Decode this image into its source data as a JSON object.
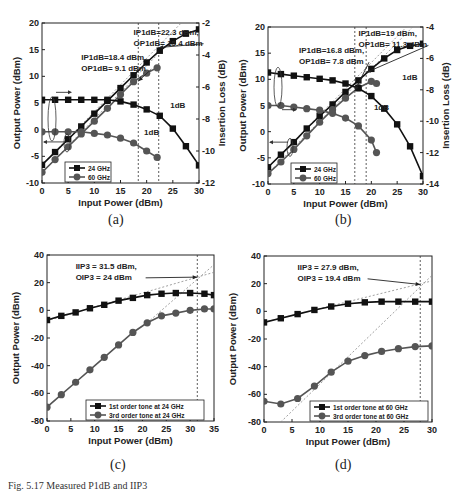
{
  "panels": [
    {
      "label": "(a)"
    },
    {
      "label": "(b)"
    },
    {
      "label": "(c)"
    },
    {
      "label": "(d)"
    }
  ],
  "caption": "Fig. 5.17  Measured P1dB and IIP3",
  "chart_data": [
    {
      "id": "a",
      "type": "line",
      "xlabel": "Input Power (dBm)",
      "ylabel": "Output Power (dBm)",
      "y2label": "Insertion Loss (dB)",
      "xlim": [
        0,
        30
      ],
      "ylim": [
        -10,
        20
      ],
      "y2lim": [
        -12,
        -2
      ],
      "xticks": [
        0,
        5,
        10,
        15,
        20,
        25,
        30
      ],
      "yticks": [
        -10,
        -5,
        0,
        5,
        10,
        15,
        20
      ],
      "y2ticks": [
        -12,
        -10,
        -8,
        -6,
        -4,
        -2
      ],
      "legend": {
        "position": "bottom-left",
        "entries": [
          "24 GHz",
          "60 GHz"
        ]
      },
      "series": [
        {
          "name": "24 GHz",
          "axis": "left",
          "marker": "square",
          "x": [
            0,
            2.5,
            5,
            7.5,
            10,
            12.5,
            15,
            17.5,
            20,
            22.5,
            25,
            27.5,
            30
          ],
          "y": [
            -6.6,
            -4.2,
            -1.8,
            0.6,
            3.0,
            5.4,
            7.8,
            10.2,
            12.6,
            14.8,
            16.6,
            18.0,
            18.8
          ]
        },
        {
          "name": "60 GHz",
          "axis": "left",
          "marker": "circle",
          "x": [
            0,
            2.5,
            5,
            7.5,
            10,
            12.5,
            15,
            17.5,
            20,
            22
          ],
          "y": [
            -8.0,
            -5.6,
            -3.2,
            -0.8,
            1.6,
            4.0,
            6.6,
            9.0,
            10.6,
            11.6
          ]
        },
        {
          "name": "24 GHz IL",
          "axis": "right",
          "marker": "square",
          "x": [
            0,
            2.5,
            5,
            7.5,
            10,
            12.5,
            15,
            17.5,
            20,
            22.5,
            25,
            27.5,
            30
          ],
          "y": [
            -6.8,
            -6.8,
            -6.8,
            -6.8,
            -6.8,
            -6.8,
            -6.9,
            -7.1,
            -7.4,
            -7.8,
            -8.6,
            -9.7,
            -10.9
          ]
        },
        {
          "name": "60 GHz IL",
          "axis": "right",
          "marker": "circle",
          "x": [
            0,
            2.5,
            5,
            7.5,
            10,
            12.5,
            15,
            17.5,
            20,
            22
          ],
          "y": [
            -8.8,
            -8.8,
            -8.8,
            -8.8,
            -8.9,
            -9.0,
            -9.2,
            -9.5,
            -10.0,
            -10.4
          ]
        }
      ],
      "guides": [
        {
          "from": [
            0,
            -6.6
          ],
          "to": [
            30,
            23.4
          ]
        },
        {
          "from": [
            0,
            -8.0
          ],
          "to": [
            22,
            14.0
          ]
        }
      ],
      "markers_v": [
        18.4,
        22.3
      ],
      "annotations": [
        {
          "text": [
            "IP1dB=22.3 dBm,",
            "OP1dB= 15.4 dBm"
          ],
          "at": [
            17.5,
            17.8
          ],
          "arrow_to": [
            22.3,
            15.4
          ]
        },
        {
          "text": [
            "IP1dB=18.4 dBm,",
            "OP1dB= 9.1 dBm"
          ],
          "at": [
            7.5,
            13.0
          ],
          "arrow_to": [
            18.4,
            9.1
          ]
        },
        {
          "text": [
            "1dB"
          ],
          "at": [
            24.5,
            4.0
          ]
        },
        {
          "text": [
            "1dB"
          ],
          "at": [
            19.5,
            -1.0
          ]
        }
      ]
    },
    {
      "id": "b",
      "type": "line",
      "xlabel": "Input Power (dBm)",
      "ylabel": "Output Power (dBm)",
      "y2label": "Insertion Loss (dB)",
      "xlim": [
        0,
        30
      ],
      "ylim": [
        -10,
        20
      ],
      "y2lim": [
        -14,
        -4
      ],
      "xticks": [
        0,
        5,
        10,
        15,
        20,
        25,
        30
      ],
      "yticks": [
        -10,
        -5,
        0,
        5,
        10,
        15,
        20
      ],
      "y2ticks": [
        -14,
        -12,
        -10,
        -8,
        -6,
        -4
      ],
      "legend": {
        "position": "bottom-left",
        "entries": [
          "24 GHz",
          "60 GHz"
        ]
      },
      "series": [
        {
          "name": "24 GHz",
          "axis": "left",
          "marker": "square",
          "x": [
            0,
            2.5,
            5,
            7.5,
            10,
            12.5,
            15,
            17.5,
            20,
            22.5,
            25,
            27.5,
            30
          ],
          "y": [
            -6.8,
            -4.4,
            -2.0,
            0.6,
            3.0,
            5.2,
            7.6,
            9.8,
            12.0,
            14.0,
            15.6,
            16.4,
            16.8
          ]
        },
        {
          "name": "60 GHz",
          "axis": "left",
          "marker": "circle",
          "x": [
            0,
            2.5,
            5,
            7.5,
            10,
            12.5,
            15,
            17.5,
            20,
            21
          ],
          "y": [
            -8.0,
            -5.8,
            -3.4,
            -0.8,
            1.8,
            4.2,
            6.4,
            8.4,
            9.6,
            9.2
          ]
        },
        {
          "name": "24 GHz IL",
          "axis": "right",
          "marker": "square",
          "x": [
            0,
            2.5,
            5,
            7.5,
            10,
            12.5,
            15,
            17.5,
            20,
            22.5,
            25,
            27.5,
            30
          ],
          "y": [
            -6.9,
            -7.0,
            -7.1,
            -7.2,
            -7.3,
            -7.4,
            -7.6,
            -7.9,
            -8.4,
            -9.2,
            -10.2,
            -11.6,
            -13.5
          ]
        },
        {
          "name": "60 GHz IL",
          "axis": "right",
          "marker": "circle",
          "x": [
            0,
            2.5,
            5,
            7.5,
            10,
            12.5,
            15,
            17.5,
            20,
            21
          ],
          "y": [
            -9.0,
            -9.0,
            -9.1,
            -9.2,
            -9.3,
            -9.5,
            -9.8,
            -10.3,
            -11.2,
            -12.0
          ]
        }
      ],
      "guides": [
        {
          "from": [
            0,
            -6.8
          ],
          "to": [
            27,
            20.2
          ]
        },
        {
          "from": [
            0,
            -8.0
          ],
          "to": [
            28,
            20.0
          ]
        }
      ],
      "markers_v": [
        16.8,
        19.0
      ],
      "annotations": [
        {
          "text": [
            "IP1dB=19 dBm,",
            "OP1dB= 11.3 dBm"
          ],
          "at": [
            17.5,
            18.2
          ],
          "arrow_to": [
            19.0,
            11.3
          ]
        },
        {
          "text": [
            "IP1dB=16.8 dBm,",
            "OP1dB= 7.8 dBm"
          ],
          "at": [
            6.0,
            15.0
          ],
          "arrow_to": [
            16.8,
            7.8
          ]
        },
        {
          "text": [
            "1dB"
          ],
          "at": [
            26.0,
            9.8
          ]
        },
        {
          "text": [
            "1dB"
          ],
          "at": [
            20.5,
            4.2
          ]
        }
      ]
    },
    {
      "id": "c",
      "type": "line",
      "xlabel": "Input Power (dBm)",
      "ylabel": "Output Power (dBm)",
      "xlim": [
        0,
        35
      ],
      "ylim": [
        -80,
        40
      ],
      "xticks": [
        0,
        5,
        10,
        15,
        20,
        25,
        30,
        35
      ],
      "yticks": [
        -80,
        -60,
        -40,
        -20,
        0,
        20,
        40
      ],
      "legend": {
        "position": "bottom-right",
        "entries": [
          "1st order tone at 24 GHz",
          "3rd order tone at 24 GHz"
        ]
      },
      "series": [
        {
          "name": "1st order tone at 24 GHz",
          "marker": "square",
          "x": [
            0,
            3,
            6,
            9,
            12,
            15,
            18,
            21,
            24,
            27,
            30,
            33,
            35
          ],
          "y": [
            -7,
            -4,
            -1.5,
            1.5,
            4,
            7,
            9,
            11,
            12,
            12.5,
            12.5,
            12,
            11
          ]
        },
        {
          "name": "3rd order tone at 24 GHz",
          "marker": "circle",
          "x": [
            0,
            3,
            6,
            9,
            12,
            15,
            18,
            21,
            24,
            27,
            30,
            33,
            35
          ],
          "y": [
            -70,
            -61,
            -52,
            -43,
            -34,
            -25,
            -16,
            -9,
            -4,
            -2,
            0,
            1,
            1
          ]
        }
      ],
      "guides": [
        {
          "from": [
            0,
            -7.5
          ],
          "to": [
            35,
            27.5
          ]
        },
        {
          "from": [
            21,
            -9
          ],
          "to": [
            35,
            33
          ]
        }
      ],
      "markers_v": [
        31.5
      ],
      "annotations": [
        {
          "text": [
            "IIP3 = 31.5 dBm,",
            "OIP3 = 24 dBm"
          ],
          "at": [
            6,
            30
          ],
          "arrow_to": [
            31.5,
            24
          ]
        }
      ]
    },
    {
      "id": "d",
      "type": "line",
      "xlabel": "Input Power (dBm)",
      "ylabel": "Output Power (dBm)",
      "xlim": [
        0,
        30
      ],
      "ylim": [
        -80,
        40
      ],
      "xticks": [
        0,
        5,
        10,
        15,
        20,
        25,
        30
      ],
      "yticks": [
        -80,
        -60,
        -40,
        -20,
        0,
        20,
        40
      ],
      "legend": {
        "position": "bottom-right",
        "entries": [
          "1st order tone at 60 GHz",
          "3rd order tone at 60 GHz"
        ]
      },
      "series": [
        {
          "name": "1st order tone at 60 GHz",
          "marker": "square",
          "x": [
            0,
            3,
            6,
            9,
            12,
            15,
            18,
            21,
            24,
            27,
            30
          ],
          "y": [
            -8,
            -5,
            -2,
            1,
            3.5,
            5.5,
            6.5,
            7,
            7,
            7,
            7
          ]
        },
        {
          "name": "3rd order tone at 60 GHz",
          "marker": "circle",
          "x": [
            0,
            3,
            6,
            9,
            12,
            15,
            18,
            21,
            24,
            27,
            30
          ],
          "y": [
            -65,
            -67,
            -63,
            -54,
            -44,
            -36,
            -32,
            -29,
            -27,
            -25.5,
            -25
          ]
        }
      ],
      "guides": [
        {
          "from": [
            0,
            -8
          ],
          "to": [
            30,
            22
          ]
        },
        {
          "from": [
            3,
            -80
          ],
          "to": [
            30,
            26
          ]
        }
      ],
      "markers_v": [
        27.9
      ],
      "annotations": [
        {
          "text": [
            "IIP3 = 27.9 dBm,",
            "OIP3 = 19.4 dBm"
          ],
          "at": [
            6,
            30
          ],
          "arrow_to": [
            27.9,
            19.4
          ]
        }
      ]
    }
  ]
}
